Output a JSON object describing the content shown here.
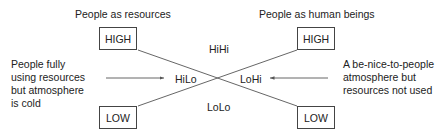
{
  "headings": {
    "left": "People as resources",
    "right": "People as human beings"
  },
  "boxes": {
    "left_high": "HIGH",
    "right_high": "HIGH",
    "left_low": "LOW",
    "right_low": "LOW"
  },
  "quadrants": {
    "top": "HiHi",
    "left": "HiLo",
    "right": "LoHi",
    "bottom": "LoLo"
  },
  "annotations": {
    "left": [
      "People fully",
      "using resources",
      "but atmosphere",
      "is cold"
    ],
    "right": [
      "A be-nice-to-people",
      "atmosphere but",
      "resources not used"
    ]
  },
  "colors": {
    "line": "#555555",
    "text": "#222222"
  }
}
